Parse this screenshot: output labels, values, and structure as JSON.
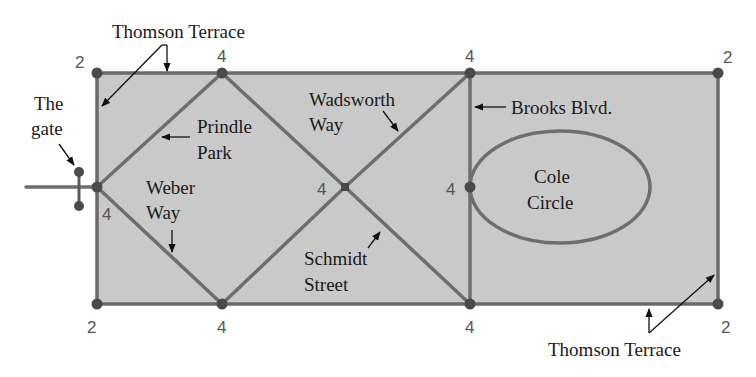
{
  "figure": {
    "type": "street-network-graph",
    "colors": {
      "block_fill": "#c9c9c9",
      "street_stroke": "#6e6e6e",
      "node_fill": "#4a4a4a",
      "label_text": "#1a1a1a",
      "degree_text": "#555555"
    }
  },
  "labels": {
    "thomson_top": "Thomson Terrace",
    "thomson_bottom": "Thomson Terrace",
    "gate_line1": "The",
    "gate_line2": "gate",
    "prindle_line1": "Prindle",
    "prindle_line2": "Park",
    "weber_line1": "Weber",
    "weber_line2": "Way",
    "wadsworth_line1": "Wadsworth",
    "wadsworth_line2": "Way",
    "schmidt_line1": "Schmidt",
    "schmidt_line2": "Street",
    "brooks": "Brooks Blvd.",
    "cole_line1": "Cole",
    "cole_line2": "Circle"
  },
  "vertices": [
    {
      "id": "top-left",
      "degree": "2"
    },
    {
      "id": "top-2",
      "degree": "4"
    },
    {
      "id": "top-3",
      "degree": "4"
    },
    {
      "id": "top-right",
      "degree": "2"
    },
    {
      "id": "mid-left",
      "degree": "4"
    },
    {
      "id": "center",
      "degree": "4"
    },
    {
      "id": "brooks-mid",
      "degree": "4"
    },
    {
      "id": "bottom-left",
      "degree": "2"
    },
    {
      "id": "bottom-2",
      "degree": "4"
    },
    {
      "id": "bottom-3",
      "degree": "4"
    },
    {
      "id": "bottom-right",
      "degree": "2"
    }
  ]
}
